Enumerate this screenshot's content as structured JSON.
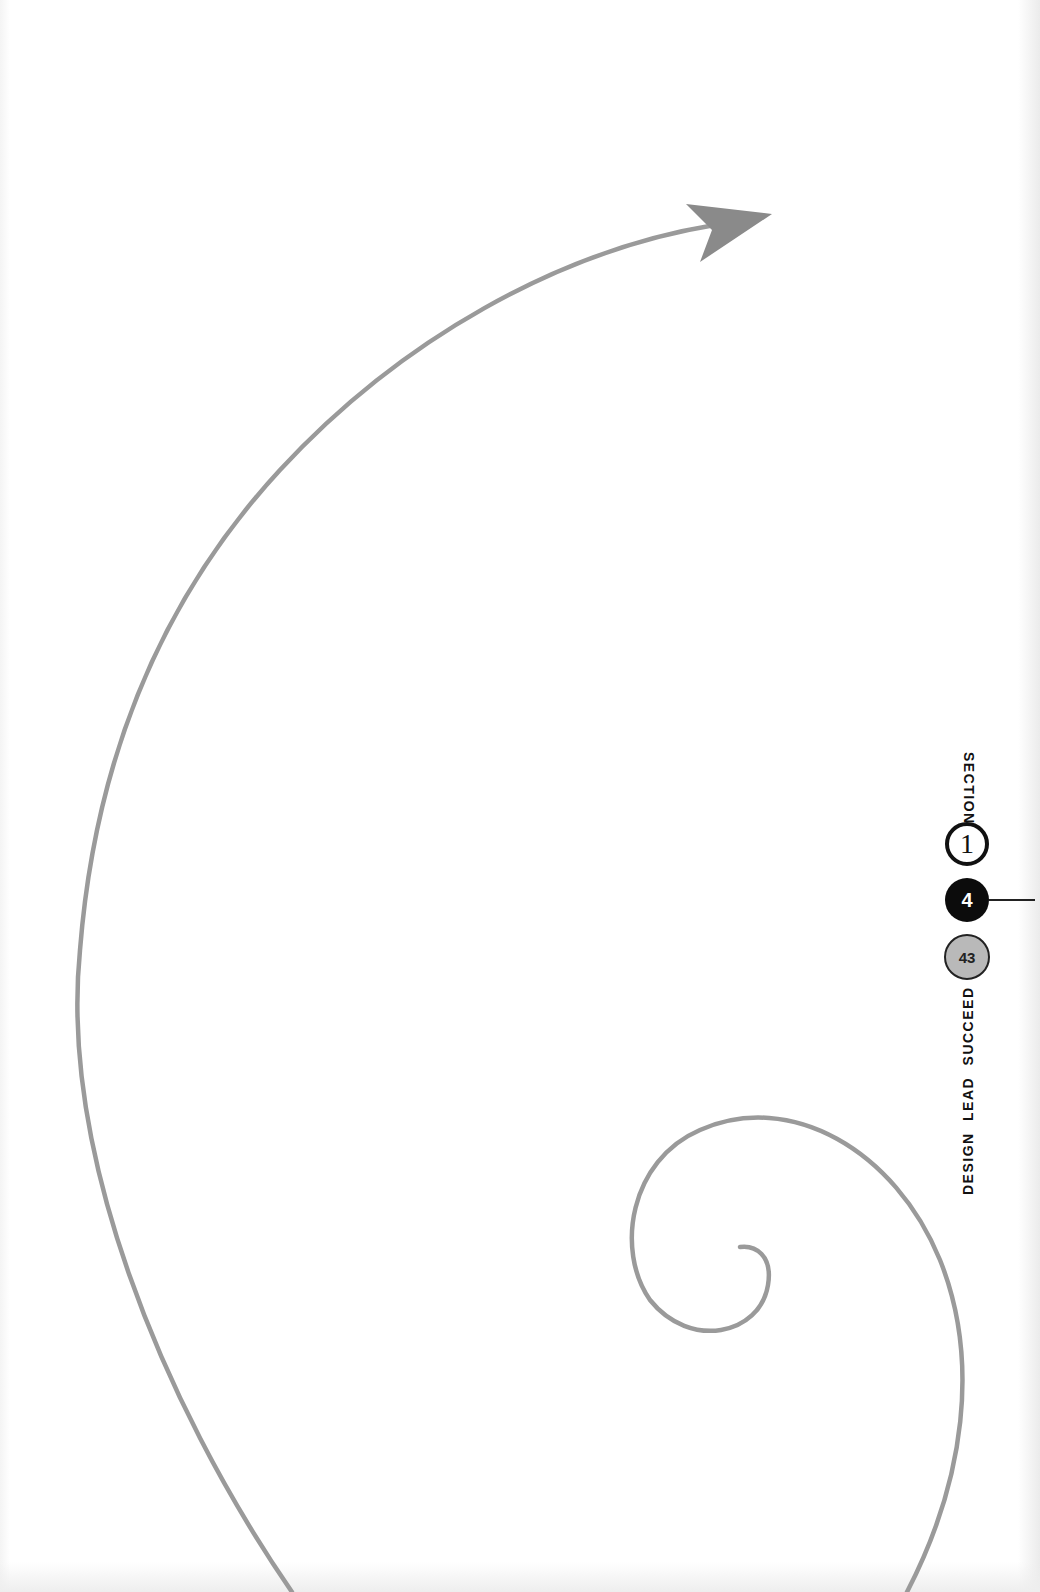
{
  "page": {
    "background": "#ffffff",
    "curve_color": "#9a9a9a",
    "arrow_color": "#8a8a8a"
  },
  "sidebar": {
    "section_label": "SECTION",
    "section_number": "1",
    "chapter_number": "4",
    "page_number": "43",
    "book_title": "DESIGN LEAD SUCCEED"
  },
  "illustration": {
    "description": "Large grey curved arrow sweeping up from bottom-left to top-right, and a grey spiral curling inward at lower right",
    "arrow_icon": "arrow-head-icon",
    "spiral_icon": "spiral-icon"
  }
}
